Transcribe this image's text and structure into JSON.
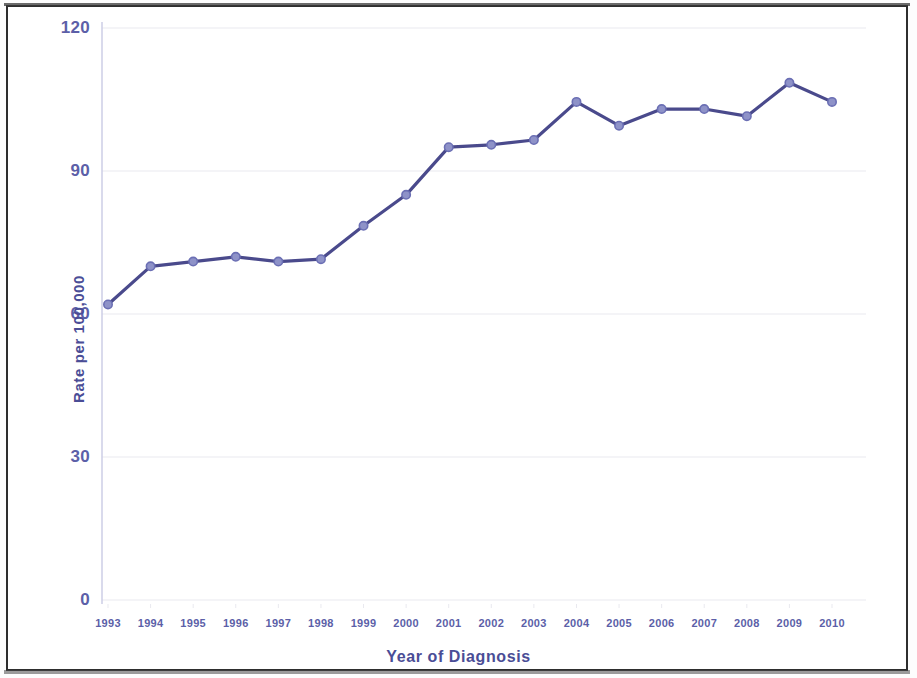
{
  "chart_data": {
    "type": "line",
    "title": "",
    "subtitle": "",
    "xlabel": "Year of Diagnosis",
    "ylabel": "Rate per 100,000",
    "categories": [
      "1993",
      "1994",
      "1995",
      "1996",
      "1997",
      "1998",
      "1999",
      "2000",
      "2001",
      "2002",
      "2003",
      "2004",
      "2005",
      "2006",
      "2007",
      "2008",
      "2009",
      "2010"
    ],
    "values": [
      62,
      70,
      71,
      72,
      71,
      71.5,
      78.5,
      85,
      95,
      95.5,
      96.5,
      104.5,
      99.5,
      103,
      103,
      101.5,
      108.5,
      104.5
    ],
    "series": [
      {
        "name": "Rate per 100,000",
        "values": [
          62,
          70,
          71,
          72,
          71,
          71.5,
          78.5,
          85,
          95,
          95.5,
          96.5,
          104.5,
          99.5,
          103,
          103,
          101.5,
          108.5,
          104.5
        ]
      }
    ],
    "ylim": [
      0,
      120
    ],
    "yticks": [
      0,
      30,
      60,
      90,
      120
    ],
    "ytick_labels": [
      "0",
      "30",
      "60",
      "90",
      "120"
    ],
    "xtick_labels": [
      "1993",
      "1994",
      "1995",
      "1996",
      "1997",
      "1998",
      "1999",
      "2000",
      "2001",
      "2002",
      "2003",
      "2004",
      "2005",
      "2006",
      "2007",
      "2008",
      "2009",
      "2010"
    ],
    "grid": true,
    "grid_axis": "y",
    "legend": false,
    "legend_position": "none",
    "annotations": [],
    "colors": {
      "line": "#4a4a8c",
      "marker_fill": "#8e92c8",
      "marker_edge": "#6b6fb4",
      "tick_label": "#5c5fa8",
      "axis_title": "#4a4d96",
      "axis_line": "#c9cbe4",
      "gridline": "#e9e9ef",
      "frame_border": "#2e2e2e",
      "plot_background": "#ffffff"
    }
  },
  "axes": {
    "y_title": "Rate per 100,000",
    "x_title": "Year of Diagnosis"
  },
  "figure": {
    "background_color": "#ffffff"
  }
}
